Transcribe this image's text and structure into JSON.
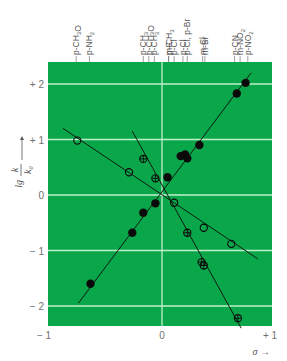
{
  "chart_data": {
    "type": "scatter",
    "title": "",
    "xlabel": "σ →",
    "ylabel": "lg k/k0",
    "xlim": [
      -1,
      1
    ],
    "ylim": [
      -2.4,
      2.4
    ],
    "x_ticks": [
      {
        "value": -1,
        "label": "− 1"
      },
      {
        "value": 0,
        "label": "0"
      },
      {
        "value": 1,
        "label": "+ 1"
      }
    ],
    "y_ticks": [
      {
        "value": 2,
        "label": "+ 2"
      },
      {
        "value": 1,
        "label": "+ 1"
      },
      {
        "value": 0,
        "label": "0"
      },
      {
        "value": -1,
        "label": "− 1"
      },
      {
        "value": -2,
        "label": "− 2"
      }
    ],
    "grid": true,
    "background_color": "#0aa64a",
    "grid_color": "#bff0cc",
    "top_substituent_labels": [
      {
        "sigma": -0.78,
        "label": "p-CH3O"
      },
      {
        "sigma": -0.66,
        "label": "p-NH2"
      },
      {
        "sigma": -0.17,
        "label": "p-CH3"
      },
      {
        "sigma": -0.12,
        "label": "p-CH3O"
      },
      {
        "sigma": -0.07,
        "label": "p-CH3"
      },
      {
        "sigma": 0.06,
        "label": "m-CH3"
      },
      {
        "sigma": 0.06,
        "label": "p-F"
      },
      {
        "sigma": 0.11,
        "label": "p-Cl"
      },
      {
        "sigma": 0.19,
        "label": "p-Cl"
      },
      {
        "sigma": 0.23,
        "label": "p-Cl, p-Br"
      },
      {
        "sigma": 0.37,
        "label": "m-Cl"
      },
      {
        "sigma": 0.39,
        "label": "m-Br"
      },
      {
        "sigma": 0.66,
        "label": "p-CN"
      },
      {
        "sigma": 0.71,
        "label": "m-NO2"
      },
      {
        "sigma": 0.78,
        "label": "p-NO2"
      }
    ],
    "series": [
      {
        "name": "filled circles (positive ρ)",
        "marker": "filled-circle",
        "points": [
          {
            "x": -0.65,
            "y": -1.6
          },
          {
            "x": -0.27,
            "y": -0.68
          },
          {
            "x": -0.17,
            "y": -0.32
          },
          {
            "x": -0.06,
            "y": -0.15
          },
          {
            "x": 0.05,
            "y": 0.32
          },
          {
            "x": 0.17,
            "y": 0.7
          },
          {
            "x": 0.21,
            "y": 0.73
          },
          {
            "x": 0.23,
            "y": 0.66
          },
          {
            "x": 0.34,
            "y": 0.9
          },
          {
            "x": 0.68,
            "y": 1.83
          },
          {
            "x": 0.76,
            "y": 2.02
          }
        ],
        "fit_line": [
          {
            "x": -0.76,
            "y": -1.95
          },
          {
            "x": 0.81,
            "y": 2.2
          }
        ]
      },
      {
        "name": "open circles (small negative ρ)",
        "marker": "open-circle",
        "points": [
          {
            "x": -0.77,
            "y": 0.98
          },
          {
            "x": -0.3,
            "y": 0.41
          },
          {
            "x": 0.11,
            "y": -0.14
          },
          {
            "x": 0.38,
            "y": -0.59
          },
          {
            "x": 0.63,
            "y": -0.88
          }
        ],
        "fit_line": [
          {
            "x": -0.9,
            "y": 1.2
          },
          {
            "x": 0.87,
            "y": -1.15
          }
        ]
      },
      {
        "name": "crossed circles (large negative ρ)",
        "marker": "crossed-circle",
        "points": [
          {
            "x": -0.17,
            "y": 0.65
          },
          {
            "x": -0.06,
            "y": 0.3
          },
          {
            "x": 0.23,
            "y": -0.68
          },
          {
            "x": 0.36,
            "y": -1.21
          },
          {
            "x": 0.38,
            "y": -1.27
          },
          {
            "x": 0.69,
            "y": -2.22
          }
        ],
        "fit_line": [
          {
            "x": -0.27,
            "y": 1.15
          },
          {
            "x": 0.72,
            "y": -2.4
          }
        ]
      }
    ]
  }
}
